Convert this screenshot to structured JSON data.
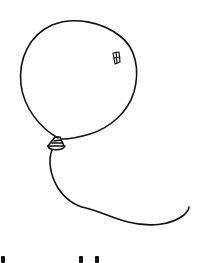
{
  "image": {
    "subject": "hand-drawn balloon",
    "description": "Black ink line drawing of a round balloon with a small window-shaped highlight, a tied knot, and a curving string",
    "colors": {
      "ink": "#111111",
      "background": "#ffffff"
    }
  },
  "cut_off_text": {
    "visible_fragments": 3
  }
}
